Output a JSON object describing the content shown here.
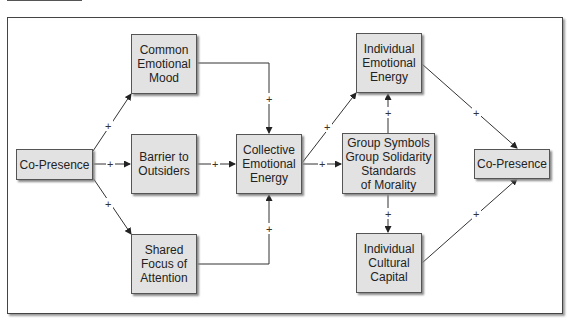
{
  "diagram": {
    "nodes": {
      "co_presence_left": {
        "label": "Co-Presence"
      },
      "common_emotional_mood": {
        "label": "Common\nEmotional\nMood"
      },
      "barrier_to_outsiders": {
        "label": "Barrier to\nOutsiders"
      },
      "shared_focus": {
        "label": "Shared\nFocus of\nAttention"
      },
      "collective_emotional_energy": {
        "label": "Collective\nEmotional\nEnergy"
      },
      "individual_emotional_energy": {
        "label": "Individual\nEmotional\nEnergy"
      },
      "group_symbols": {
        "label": "Group Symbols\nGroup Solidarity\nStandards\nof Morality"
      },
      "individual_cultural_capital": {
        "label": "Individual\nCultural\nCapital"
      },
      "co_presence_right": {
        "label": "Co-Presence"
      }
    },
    "edge_sign": "+",
    "edges": [
      {
        "from": "Co-Presence",
        "to": "Common Emotional Mood",
        "sign": "+"
      },
      {
        "from": "Co-Presence",
        "to": "Barrier to Outsiders",
        "sign": "+"
      },
      {
        "from": "Co-Presence",
        "to": "Shared Focus of Attention",
        "sign": "+"
      },
      {
        "from": "Common Emotional Mood",
        "to": "Collective Emotional Energy",
        "sign": "+"
      },
      {
        "from": "Barrier to Outsiders",
        "to": "Collective Emotional Energy",
        "sign": "+"
      },
      {
        "from": "Shared Focus of Attention",
        "to": "Collective Emotional Energy",
        "sign": "+"
      },
      {
        "from": "Collective Emotional Energy",
        "to": "Individual Emotional Energy",
        "sign": "+"
      },
      {
        "from": "Collective Emotional Energy",
        "to": "Group Symbols / Group Solidarity / Standards of Morality",
        "sign": "+"
      },
      {
        "from": "Group Symbols / Group Solidarity / Standards of Morality",
        "to": "Individual Emotional Energy",
        "sign": "+"
      },
      {
        "from": "Group Symbols / Group Solidarity / Standards of Morality",
        "to": "Individual Cultural Capital",
        "sign": "+"
      },
      {
        "from": "Individual Emotional Energy",
        "to": "Co-Presence",
        "sign": "+"
      },
      {
        "from": "Individual Cultural Capital",
        "to": "Co-Presence",
        "sign": "+"
      }
    ]
  }
}
